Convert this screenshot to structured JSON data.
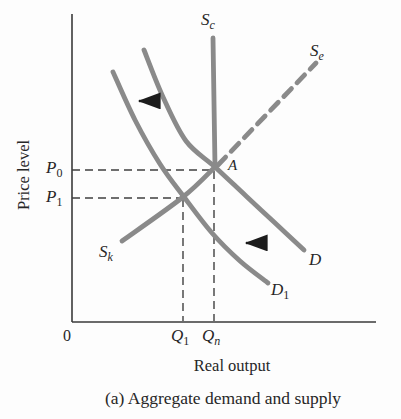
{
  "figure": {
    "caption": "(a) Aggregate demand and supply",
    "y_axis_label": "Price level",
    "x_axis_label": "Real output",
    "origin_label": "0",
    "labels": {
      "sc": {
        "base": "S",
        "sub": "c"
      },
      "se": {
        "base": "S",
        "sub": "e"
      },
      "sk": {
        "base": "S",
        "sub": "k"
      },
      "d": {
        "base": "D",
        "sub": ""
      },
      "d1": {
        "base": "D",
        "sub": "1"
      },
      "p0": {
        "base": "P",
        "sub": "0"
      },
      "p1": {
        "base": "P",
        "sub": "1"
      },
      "q1": {
        "base": "Q",
        "sub": "1"
      },
      "qn": {
        "base": "Q",
        "sub": "n"
      },
      "a": {
        "base": "A",
        "sub": ""
      }
    },
    "colors": {
      "curve_gray": "#8a8a8a",
      "axis_dark": "#3a3a3a",
      "arrow_black": "#1c1c1c",
      "text": "#272727",
      "background": "#fdfdfd"
    }
  },
  "chart_data": {
    "type": "line",
    "title": "(a) Aggregate demand and supply",
    "xlabel": "Real output",
    "ylabel": "Price level",
    "axis_numeric": false,
    "grid": false,
    "x_tick_labels": [
      "0",
      "Q1",
      "Qn"
    ],
    "y_tick_labels": [
      "P0",
      "P1"
    ],
    "series": [
      {
        "name": "Sc",
        "style": "solid",
        "role": "classical (vertical) aggregate supply at Qn, above point A"
      },
      {
        "name": "Se",
        "style": "dashed",
        "role": "supply segment rising to upper right from point A"
      },
      {
        "name": "Sk",
        "style": "solid",
        "role": "Keynesian upward-sloping aggregate supply ending at A"
      },
      {
        "name": "D",
        "style": "solid",
        "role": "aggregate demand through A at (Qn, P0)"
      },
      {
        "name": "D1",
        "style": "solid",
        "role": "aggregate demand shifted left, crossing Sk at (Q1, P1)"
      }
    ],
    "key_points": {
      "A": {
        "x": "Qn",
        "y": "P0",
        "meaning": "initial equilibrium of D, Sc, Sk"
      },
      "shifted_equilibrium": {
        "x": "Q1",
        "y": "P1",
        "meaning": "intersection of D1 and Sk"
      }
    },
    "annotations": [
      "left-pointing arrow between D1 and D (upper area) showing leftward demand shift",
      "left-pointing arrow between D1 and D (lower area) showing leftward demand shift"
    ],
    "series_px": {
      "sc": [
        [
          213,
          38
        ],
        [
          215,
          167
        ]
      ],
      "se": [
        [
          218,
          165
        ],
        [
          316,
          63
        ]
      ],
      "sk": [
        [
          122,
          241
        ],
        [
          183,
          197
        ],
        [
          215,
          167
        ]
      ],
      "d": [
        [
          144,
          50
        ],
        [
          163,
          97
        ],
        [
          186,
          141
        ],
        [
          215,
          167
        ],
        [
          246,
          196
        ],
        [
          274,
          222
        ],
        [
          304,
          250
        ]
      ],
      "d1": [
        [
          113,
          72
        ],
        [
          135,
          120
        ],
        [
          160,
          164
        ],
        [
          184,
          197
        ],
        [
          212,
          233
        ],
        [
          240,
          261
        ],
        [
          268,
          283
        ]
      ]
    },
    "geometry_px": {
      "y_axis": [
        72,
        14,
        72,
        322
      ],
      "x_axis": [
        72,
        322,
        376,
        322
      ],
      "p0_guide": [
        72,
        170,
        212,
        170
      ],
      "p1_guide": [
        72,
        198,
        182,
        198
      ],
      "q1_guide": [
        183,
        199,
        183,
        321
      ],
      "qn_guide": [
        214,
        171,
        214,
        321
      ],
      "arrow_upper": [
        160,
        101,
        139,
        101
      ],
      "arrow_lower": [
        267,
        243,
        246,
        243
      ]
    }
  }
}
